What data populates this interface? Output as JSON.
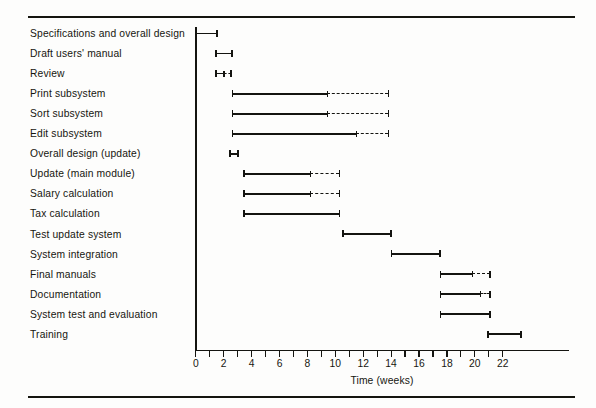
{
  "figure": {
    "background_color": "#fdfdfc",
    "ink_color": "#141410"
  },
  "chart_data": {
    "type": "bar",
    "title": "",
    "subtitle": "",
    "xlabel": "Time (weeks)",
    "ylabel": "",
    "xlim": [
      0,
      22
    ],
    "xtick_step_minor": 1,
    "xtick_step_major": 2,
    "xticks": [
      0,
      2,
      4,
      6,
      8,
      10,
      12,
      14,
      16,
      18,
      20,
      22
    ],
    "xtick_labels": [
      "0",
      "2",
      "4",
      "6",
      "8",
      "10",
      "12",
      "14",
      "16",
      "18",
      "20",
      "22"
    ],
    "grid": false,
    "legend": "none",
    "orientation": "horizontal",
    "note": "Gantt chart: solid segment = scheduled/actual duration, dashed segment = slack / extension",
    "categories": [
      "Specifications and overall design",
      "Draft users' manual",
      "Review",
      "Print subsystem",
      "Sort subsystem",
      "Edit subsystem",
      "Overall design (update)",
      "Update (main module)",
      "Salary calculation",
      "Tax calculation",
      "Test update system",
      "System integration",
      "Final manuals",
      "Documentation",
      "System test and evaluation",
      "Training"
    ],
    "tasks": [
      {
        "name": "Specifications and overall design",
        "start": 0.0,
        "solid_end": 1.5,
        "dashed_end": null
      },
      {
        "name": "Draft users' manual",
        "start": 1.4,
        "solid_end": 2.6,
        "dashed_end": null
      },
      {
        "name": "Review",
        "start": 1.4,
        "solid_end": 2.0,
        "dashed_end": 2.5
      },
      {
        "name": "Print subsystem",
        "start": 2.6,
        "solid_end": 9.4,
        "dashed_end": 13.8
      },
      {
        "name": "Sort subsystem",
        "start": 2.6,
        "solid_end": 9.4,
        "dashed_end": 13.8
      },
      {
        "name": "Edit subsystem",
        "start": 2.6,
        "solid_end": 11.5,
        "dashed_end": 13.8
      },
      {
        "name": "Overall design (update)",
        "start": 2.4,
        "solid_end": 3.0,
        "dashed_end": null
      },
      {
        "name": "Update (main module)",
        "start": 3.4,
        "solid_end": 8.2,
        "dashed_end": 10.3
      },
      {
        "name": "Salary calculation",
        "start": 3.4,
        "solid_end": 8.2,
        "dashed_end": 10.3
      },
      {
        "name": "Tax calculation",
        "start": 3.4,
        "solid_end": 10.3,
        "dashed_end": null
      },
      {
        "name": "Test update system",
        "start": 10.5,
        "solid_end": 14.0,
        "dashed_end": null
      },
      {
        "name": "System integration",
        "start": 14.0,
        "solid_end": 17.5,
        "dashed_end": null
      },
      {
        "name": "Final manuals",
        "start": 17.5,
        "solid_end": 19.8,
        "dashed_end": 21.1
      },
      {
        "name": "Documentation",
        "start": 17.5,
        "solid_end": 20.4,
        "dashed_end": 21.1
      },
      {
        "name": "System test and evaluation",
        "start": 17.5,
        "solid_end": 21.1,
        "dashed_end": null
      },
      {
        "name": "Training",
        "start": 20.9,
        "solid_end": 23.3,
        "dashed_end": null
      }
    ]
  }
}
